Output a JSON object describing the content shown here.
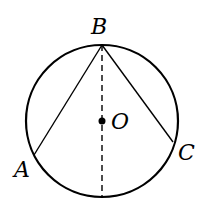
{
  "diagram": {
    "type": "geometry",
    "circle": {
      "center": "O",
      "cx": 102,
      "cy": 121,
      "r": 76
    },
    "points": {
      "B": {
        "label": "B",
        "x": 102,
        "y": 45,
        "label_x": 91,
        "label_y": 34
      },
      "A": {
        "label": "A",
        "x": 34,
        "y": 155,
        "label_x": 14,
        "label_y": 177
      },
      "C": {
        "label": "C",
        "x": 173,
        "y": 142,
        "label_x": 178,
        "label_y": 160
      },
      "O": {
        "label": "O",
        "x": 102,
        "y": 121,
        "label_x": 111,
        "label_y": 129
      }
    },
    "segments": [
      {
        "from": "B",
        "to": "A",
        "style": "solid"
      },
      {
        "from": "B",
        "to": "C",
        "style": "solid"
      },
      {
        "from": "B",
        "to": "bottom",
        "style": "dashed"
      }
    ],
    "colors": {
      "stroke": "#000000",
      "background": "#ffffff"
    }
  }
}
